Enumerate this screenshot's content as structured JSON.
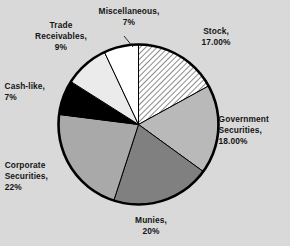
{
  "figure": {
    "background_color": "#d9d9d9",
    "text_color": "#151515"
  },
  "chart_data": {
    "type": "pie",
    "title": "",
    "xlabel": "",
    "ylabel": "",
    "legend": "none",
    "labels_position": "outside",
    "start_angle_deg": 0,
    "direction": "clockwise",
    "categories": [
      "Stock",
      "Government Securities",
      "Munies",
      "Corporate Securities",
      "Cash-like",
      "Trade Receivables",
      "Miscellaneous"
    ],
    "values": [
      17,
      18,
      20,
      22,
      7,
      9,
      7
    ],
    "value_labels": [
      "17.00%",
      "18.00%",
      "20%",
      "22%",
      "7%",
      "9%",
      "7%"
    ],
    "slice_fills": [
      "#ffffff",
      "#b9b9b9",
      "#808080",
      "#a9a9a9",
      "#000000",
      "#ebebeb",
      "#ffffff"
    ],
    "slice_patterns": [
      "diagonal-hatch",
      "solid",
      "solid",
      "solid",
      "solid",
      "solid",
      "solid"
    ],
    "slice_outline_color": "#000000"
  },
  "labels": {
    "stock": "Stock,\n17.00%",
    "government_securities": "Government\nSecurities,\n18.00%",
    "munies": "Munies,\n20%",
    "corporate_securities": "Corporate\nSecurities,\n22%",
    "cash_like": "Cash-like,\n7%",
    "trade_receivables": "Trade\nReceivables,\n9%",
    "miscellaneous": "Miscellaneous,\n7%"
  }
}
